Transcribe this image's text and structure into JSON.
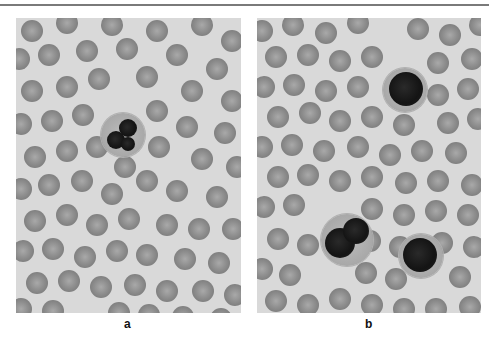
{
  "figure": {
    "panels": [
      {
        "id": "a",
        "label": "a",
        "description": "Blood smear with one segmented neutrophil among erythrocytes",
        "rbcs": [
          [
            5,
            2,
            22
          ],
          [
            40,
            -6,
            22
          ],
          [
            85,
            -4,
            22
          ],
          [
            130,
            2,
            22
          ],
          [
            175,
            -4,
            22
          ],
          [
            205,
            12,
            22
          ],
          [
            -8,
            30,
            22
          ],
          [
            22,
            26,
            22
          ],
          [
            60,
            22,
            22
          ],
          [
            100,
            20,
            22
          ],
          [
            150,
            26,
            22
          ],
          [
            190,
            40,
            22
          ],
          [
            5,
            62,
            22
          ],
          [
            40,
            58,
            22
          ],
          [
            72,
            50,
            22
          ],
          [
            120,
            48,
            22
          ],
          [
            165,
            62,
            22
          ],
          [
            205,
            72,
            22
          ],
          [
            -6,
            95,
            22
          ],
          [
            25,
            92,
            22
          ],
          [
            56,
            86,
            22
          ],
          [
            130,
            82,
            22
          ],
          [
            160,
            98,
            22
          ],
          [
            198,
            104,
            22
          ],
          [
            8,
            128,
            22
          ],
          [
            40,
            122,
            22
          ],
          [
            70,
            118,
            22
          ],
          [
            98,
            138,
            22
          ],
          [
            132,
            118,
            22
          ],
          [
            175,
            130,
            22
          ],
          [
            210,
            138,
            22
          ],
          [
            -6,
            160,
            22
          ],
          [
            22,
            156,
            22
          ],
          [
            55,
            152,
            22
          ],
          [
            85,
            165,
            22
          ],
          [
            120,
            152,
            22
          ],
          [
            150,
            162,
            22
          ],
          [
            190,
            168,
            22
          ],
          [
            8,
            192,
            22
          ],
          [
            40,
            186,
            22
          ],
          [
            70,
            196,
            22
          ],
          [
            102,
            190,
            22
          ],
          [
            140,
            196,
            22
          ],
          [
            172,
            200,
            22
          ],
          [
            206,
            200,
            22
          ],
          [
            -4,
            222,
            22
          ],
          [
            26,
            220,
            22
          ],
          [
            58,
            228,
            22
          ],
          [
            90,
            222,
            22
          ],
          [
            120,
            226,
            22
          ],
          [
            158,
            230,
            22
          ],
          [
            192,
            234,
            22
          ],
          [
            10,
            254,
            22
          ],
          [
            42,
            252,
            22
          ],
          [
            74,
            258,
            22
          ],
          [
            108,
            256,
            22
          ],
          [
            140,
            262,
            22
          ],
          [
            176,
            262,
            22
          ],
          [
            208,
            266,
            22
          ],
          [
            -6,
            280,
            22
          ],
          [
            26,
            282,
            22
          ],
          [
            92,
            284,
            22
          ],
          [
            122,
            286,
            22
          ],
          [
            156,
            288,
            22
          ],
          [
            194,
            290,
            22
          ]
        ],
        "wbcs": [
          {
            "x": 85,
            "y": 95,
            "d": 44,
            "lobes": [
              [
                18,
                6,
                18
              ],
              [
                6,
                18,
                18
              ],
              [
                20,
                24,
                14
              ]
            ]
          }
        ]
      },
      {
        "id": "b",
        "label": "b",
        "description": "Blood smear with three leukocytes among erythrocytes",
        "rbcs": [
          [
            -6,
            2,
            22
          ],
          [
            25,
            -4,
            22
          ],
          [
            58,
            4,
            22
          ],
          [
            90,
            -6,
            22
          ],
          [
            150,
            0,
            22
          ],
          [
            182,
            6,
            22
          ],
          [
            212,
            -4,
            22
          ],
          [
            8,
            28,
            22
          ],
          [
            40,
            26,
            22
          ],
          [
            72,
            32,
            22
          ],
          [
            104,
            28,
            22
          ],
          [
            170,
            34,
            22
          ],
          [
            204,
            30,
            22
          ],
          [
            -4,
            58,
            22
          ],
          [
            26,
            56,
            22
          ],
          [
            58,
            62,
            22
          ],
          [
            90,
            58,
            22
          ],
          [
            170,
            66,
            22
          ],
          [
            200,
            60,
            22
          ],
          [
            10,
            88,
            22
          ],
          [
            42,
            84,
            22
          ],
          [
            72,
            92,
            22
          ],
          [
            104,
            88,
            22
          ],
          [
            136,
            96,
            22
          ],
          [
            180,
            94,
            22
          ],
          [
            210,
            90,
            22
          ],
          [
            -6,
            118,
            22
          ],
          [
            24,
            116,
            22
          ],
          [
            56,
            122,
            22
          ],
          [
            90,
            118,
            22
          ],
          [
            122,
            126,
            22
          ],
          [
            154,
            122,
            22
          ],
          [
            188,
            124,
            22
          ],
          [
            10,
            148,
            22
          ],
          [
            40,
            146,
            22
          ],
          [
            72,
            152,
            22
          ],
          [
            104,
            148,
            22
          ],
          [
            138,
            154,
            22
          ],
          [
            170,
            152,
            22
          ],
          [
            204,
            156,
            22
          ],
          [
            -4,
            178,
            22
          ],
          [
            26,
            176,
            22
          ],
          [
            104,
            180,
            22
          ],
          [
            136,
            186,
            22
          ],
          [
            168,
            182,
            22
          ],
          [
            200,
            186,
            22
          ],
          [
            10,
            210,
            22
          ],
          [
            40,
            216,
            22
          ],
          [
            102,
            212,
            22
          ],
          [
            132,
            218,
            22
          ],
          [
            174,
            214,
            22
          ],
          [
            206,
            218,
            22
          ],
          [
            -6,
            240,
            22
          ],
          [
            22,
            246,
            22
          ],
          [
            98,
            244,
            22
          ],
          [
            128,
            250,
            22
          ],
          [
            192,
            248,
            22
          ],
          [
            8,
            272,
            22
          ],
          [
            40,
            276,
            22
          ],
          [
            72,
            270,
            22
          ],
          [
            104,
            276,
            22
          ],
          [
            136,
            280,
            22
          ],
          [
            168,
            280,
            22
          ],
          [
            202,
            278,
            22
          ]
        ],
        "wbcs": [
          {
            "x": 126,
            "y": 50,
            "d": 44,
            "lobes": [
              [
                6,
                4,
                34
              ]
            ]
          },
          {
            "x": 64,
            "y": 196,
            "d": 52,
            "lobes": [
              [
                4,
                14,
                30
              ],
              [
                22,
                4,
                26
              ]
            ]
          },
          {
            "x": 142,
            "y": 216,
            "d": 44,
            "lobes": [
              [
                4,
                4,
                34
              ]
            ]
          }
        ]
      }
    ]
  }
}
